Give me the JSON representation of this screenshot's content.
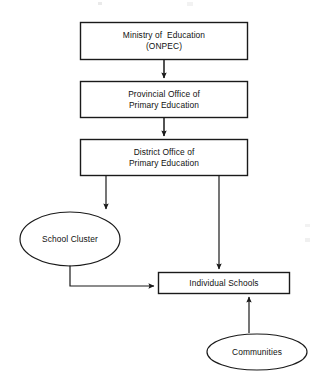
{
  "diagram": {
    "type": "organizational-flowchart",
    "background_color": "#ffffff",
    "line_color": "#1a1a1a",
    "text_color": "#111111",
    "nodes": [
      {
        "id": "ministry",
        "shape": "rectangle",
        "lines": [
          "Ministry of  Education",
          "(ONPEC)"
        ],
        "x": 80,
        "y": 22,
        "w": 168,
        "h": 38
      },
      {
        "id": "provincial",
        "shape": "rectangle",
        "lines": [
          "Provincial Office of",
          "Primary Education"
        ],
        "x": 80,
        "y": 81,
        "w": 168,
        "h": 37
      },
      {
        "id": "district",
        "shape": "rectangle",
        "lines": [
          "District Office of",
          "Primary Education"
        ],
        "x": 80,
        "y": 139,
        "w": 168,
        "h": 37
      },
      {
        "id": "school-cluster",
        "shape": "ellipse",
        "lines": [
          "School Cluster"
        ],
        "x": 20,
        "y": 212,
        "w": 100,
        "h": 54
      },
      {
        "id": "individual-schools",
        "shape": "rectangle",
        "lines": [
          "Individual Schools"
        ],
        "x": 158,
        "y": 272,
        "w": 132,
        "h": 22
      },
      {
        "id": "communities",
        "shape": "ellipse",
        "lines": [
          "Communities"
        ],
        "x": 207,
        "y": 334,
        "w": 100,
        "h": 36
      }
    ],
    "edges": [
      {
        "id": "ministry-to-provincial",
        "from": "ministry",
        "to": "provincial",
        "style": "straight-vertical",
        "arrow": "end"
      },
      {
        "id": "provincial-to-district",
        "from": "provincial",
        "to": "district",
        "style": "straight-vertical",
        "arrow": "end"
      },
      {
        "id": "district-to-school-cluster",
        "from": "district",
        "to": "school-cluster",
        "style": "straight-vertical",
        "arrow": "end"
      },
      {
        "id": "district-to-individual-schools",
        "from": "district",
        "to": "individual-schools",
        "style": "straight-vertical",
        "arrow": "end"
      },
      {
        "id": "school-cluster-to-individual-schools",
        "from": "school-cluster",
        "to": "individual-schools",
        "style": "elbow",
        "arrow": "end"
      },
      {
        "id": "communities-to-individual-schools",
        "from": "communities",
        "to": "individual-schools",
        "style": "straight-vertical",
        "arrow": "end"
      }
    ]
  }
}
